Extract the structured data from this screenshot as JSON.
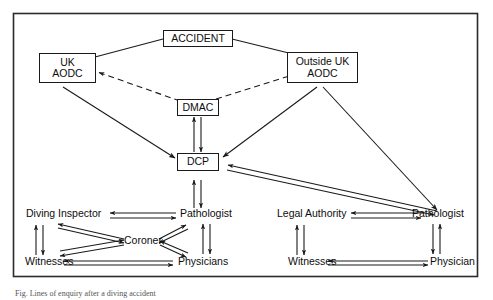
{
  "figure": {
    "caption": "Fig. Lines of enquiry after a diving accident",
    "frame": {
      "stroke": "#2b2b2b"
    },
    "line_color": "#1a1a1a",
    "nodes": {
      "accident": {
        "label": "ACCIDENT",
        "boxed": true
      },
      "uk_aodc": {
        "label_line1": "UK",
        "label_line2": "AODC",
        "boxed": true
      },
      "outside_uk_aodc": {
        "label_line1": "Outside UK",
        "label_line2": "AODC",
        "boxed": true
      },
      "dmac": {
        "label": "DMAC",
        "boxed": true
      },
      "dcp": {
        "label": "DCP",
        "boxed": true
      },
      "diving_inspector": {
        "label": "Diving Inspector",
        "boxed": false
      },
      "pathologist_left": {
        "label": "Pathologist",
        "boxed": false
      },
      "coroner": {
        "label": "Coroner",
        "boxed": false
      },
      "witnesses_left": {
        "label": "Witnesses",
        "boxed": false
      },
      "physicians": {
        "label": "Physicians",
        "boxed": false
      },
      "legal_authority": {
        "label": "Legal Authority",
        "boxed": false
      },
      "pathologist_right": {
        "label": "Pathologist",
        "boxed": false
      },
      "witnesses_right": {
        "label": "Witnesses",
        "boxed": false
      },
      "physician": {
        "label": "Physician",
        "boxed": false
      }
    },
    "edges": [
      {
        "from": "accident",
        "to": "uk_aodc",
        "style": "solid",
        "arrow": "none"
      },
      {
        "from": "accident",
        "to": "outside_uk_aodc",
        "style": "solid",
        "arrow": "none"
      },
      {
        "from": "dmac",
        "to": "uk_aodc",
        "style": "dashed",
        "arrow": "single"
      },
      {
        "from": "dmac",
        "to": "outside_uk_aodc",
        "style": "dashed",
        "arrow": "single"
      },
      {
        "from": "dmac",
        "to": "dcp",
        "style": "solid",
        "arrow": "double-pair"
      },
      {
        "from": "uk_aodc",
        "to": "dcp",
        "style": "solid",
        "arrow": "single"
      },
      {
        "from": "outside_uk_aodc",
        "to": "dcp",
        "style": "solid",
        "arrow": "single"
      },
      {
        "from": "outside_uk_aodc",
        "to": "pathologist_right",
        "style": "solid",
        "arrow": "single"
      },
      {
        "from": "dcp",
        "to": "pathologist_right",
        "style": "solid",
        "arrow": "double-pair"
      },
      {
        "from": "dcp",
        "to": "pathologist_left",
        "style": "solid",
        "arrow": "double-pair"
      },
      {
        "from": "diving_inspector",
        "to": "pathologist_left",
        "style": "solid",
        "arrow": "double-pair"
      },
      {
        "from": "diving_inspector",
        "to": "witnesses_left",
        "style": "solid",
        "arrow": "double-pair"
      },
      {
        "from": "diving_inspector",
        "to": "coroner",
        "style": "solid",
        "arrow": "double-pair"
      },
      {
        "from": "witnesses_left",
        "to": "coroner",
        "style": "solid",
        "arrow": "double-pair"
      },
      {
        "from": "witnesses_left",
        "to": "physicians",
        "style": "solid",
        "arrow": "double-pair"
      },
      {
        "from": "coroner",
        "to": "pathologist_left",
        "style": "solid",
        "arrow": "double-pair"
      },
      {
        "from": "coroner",
        "to": "physicians",
        "style": "solid",
        "arrow": "double-pair"
      },
      {
        "from": "pathologist_left",
        "to": "physicians",
        "style": "solid",
        "arrow": "double-pair"
      },
      {
        "from": "legal_authority",
        "to": "pathologist_right",
        "style": "solid",
        "arrow": "double-pair"
      },
      {
        "from": "legal_authority",
        "to": "witnesses_right",
        "style": "solid",
        "arrow": "double-pair"
      },
      {
        "from": "witnesses_right",
        "to": "physician",
        "style": "solid",
        "arrow": "double-pair"
      },
      {
        "from": "pathologist_right",
        "to": "physician",
        "style": "solid",
        "arrow": "double-pair"
      }
    ]
  }
}
